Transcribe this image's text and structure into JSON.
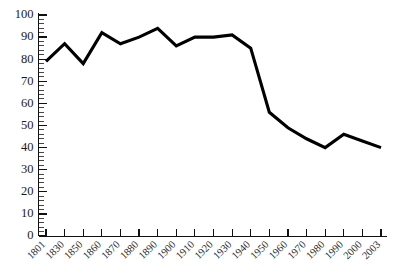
{
  "chart_data": {
    "type": "line",
    "title": "",
    "subtitle": "",
    "xlabel": "",
    "ylabel": "",
    "categories": [
      "1801",
      "1830",
      "1850",
      "1860",
      "1870",
      "1880",
      "1890",
      "1900",
      "1910",
      "1920",
      "1930",
      "1940",
      "1950",
      "1960",
      "1970",
      "1980",
      "1990",
      "2000",
      "2003"
    ],
    "values": [
      79,
      87,
      78,
      92,
      87,
      90,
      94,
      86,
      90,
      90,
      91,
      85,
      56,
      49,
      44,
      40,
      46,
      43,
      40
    ],
    "series": [
      {
        "name": "",
        "values": [
          79,
          87,
          78,
          92,
          87,
          90,
          94,
          86,
          90,
          90,
          91,
          85,
          56,
          49,
          44,
          40,
          46,
          43,
          40
        ]
      }
    ],
    "ylim": [
      0,
      100
    ],
    "yticks": [
      0,
      10,
      20,
      30,
      40,
      50,
      60,
      70,
      80,
      90,
      100
    ],
    "ytick_labels": [
      "0",
      "10",
      "20",
      "30",
      "40",
      "50",
      "60",
      "70",
      "80",
      "90",
      "100"
    ],
    "minor_tick_step": 2,
    "grid": false,
    "legend": false,
    "legend_position": "none",
    "line_color": "#000000",
    "axis_color": "#111111",
    "background_color": "#ffffff",
    "xtick_rotation_degrees": 45
  },
  "axes": {
    "y_axis_name": "y-axis",
    "x_axis_name": "x-axis"
  }
}
